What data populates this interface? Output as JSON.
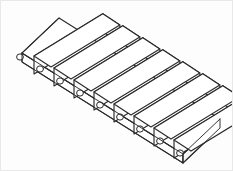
{
  "figure": {
    "title": "Isometric line drawing of stepped rib assembly on perforated base plate",
    "caption": "",
    "type": "technical-line-drawing",
    "projection": "isometric",
    "background_color": "#fdfdfd",
    "line_color": "#2b2b2b",
    "fill_color": "#ffffff",
    "frame_color": "#e8e8e8",
    "canvas": {
      "width": 233,
      "height": 171
    }
  },
  "geometry": {
    "base_plate": {
      "name": "base-plate",
      "visible_faces": [
        "top",
        "front-left-edge",
        "right-end"
      ],
      "thickness_px": 9,
      "outline_points": "21,52 58,17 219,118 182,153",
      "hole_count": 9,
      "hole_radius_px": 3.1,
      "holes": [
        {
          "cx": 19,
          "cy": 56
        },
        {
          "cx": 39,
          "cy": 68
        },
        {
          "cx": 59,
          "cy": 80
        },
        {
          "cx": 79,
          "cy": 92
        },
        {
          "cx": 99,
          "cy": 104
        },
        {
          "cx": 119,
          "cy": 116
        },
        {
          "cx": 139,
          "cy": 128
        },
        {
          "cx": 159,
          "cy": 140
        },
        {
          "cx": 179,
          "cy": 152
        }
      ]
    },
    "ribs": {
      "name": "stepped-rib-array",
      "count": 9,
      "description": "Nine identical L-shaped / stepped rectangular ribs arranged in a staircase along the plate",
      "step_offset_x": 20,
      "step_offset_y": 12,
      "rib_length_px": 74,
      "rib_width_px": 17,
      "rib_height_px": 18,
      "origin": {
        "x": 36,
        "y": 22
      }
    }
  },
  "labels": {
    "none_visible": true
  }
}
